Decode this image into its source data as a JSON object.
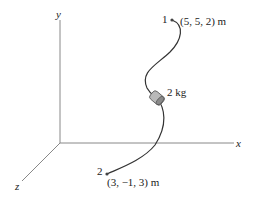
{
  "diagram": {
    "axes": {
      "x": "x",
      "y": "y",
      "z": "z"
    },
    "point1": {
      "label": "1",
      "coords": "(5, 5, 2) m"
    },
    "point2": {
      "label": "2",
      "coords": "(3, −1, 3) m"
    },
    "collar": {
      "mass": "2 kg"
    }
  }
}
